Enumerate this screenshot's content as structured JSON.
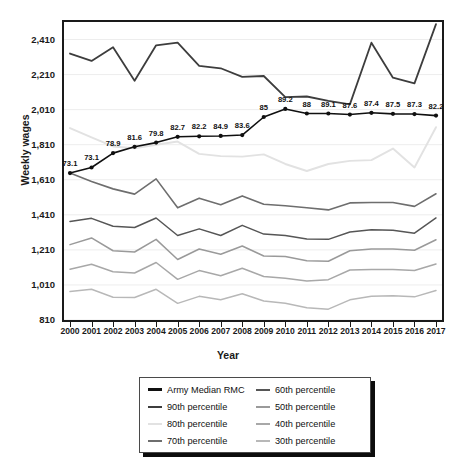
{
  "figure": {
    "y_axis_title": "Weekly wages",
    "x_axis_title": "Year"
  },
  "chart_data": {
    "type": "line",
    "title": "",
    "xlabel": "Year",
    "ylabel": "Weekly wages",
    "ylim": [
      810,
      2510
    ],
    "grid": true,
    "legend_position": "below-plot",
    "y_ticks": [
      "810",
      "1,010",
      "1,210",
      "1,410",
      "1,610",
      "1,810",
      "2,010",
      "2,210",
      "2,410"
    ],
    "y_tick_values": [
      810,
      1010,
      1210,
      1410,
      1610,
      1810,
      2010,
      2210,
      2410
    ],
    "categories": [
      "2000",
      "2001",
      "2002",
      "2003",
      "2004",
      "2005",
      "2006",
      "2007",
      "2008",
      "2009",
      "2010",
      "2011",
      "2012",
      "2013",
      "2014",
      "2015",
      "2016",
      "2017"
    ],
    "point_labels": [
      "73.1",
      "73.1",
      "78.9",
      "81.6",
      "79.8",
      "82.7",
      "82.2",
      "84.9",
      "83.6",
      "85",
      "89.2",
      "88",
      "89.1",
      "87.6",
      "87.4",
      "87.5",
      "87.3",
      "82.2"
    ],
    "series": [
      {
        "name": "Army Median RMC",
        "color": "#101010",
        "width": 1.6,
        "markers": true,
        "labelled": true,
        "values": [
          1648,
          1680,
          1762,
          1798,
          1822,
          1855,
          1858,
          1860,
          1865,
          1968,
          2014,
          1988,
          1988,
          1982,
          1992,
          1986,
          1985,
          1976
        ]
      },
      {
        "name": "90th percentile",
        "color": "#3d3d3d",
        "width": 1.8,
        "markers": false,
        "labelled": false,
        "values": [
          2330,
          2288,
          2366,
          2175,
          2377,
          2392,
          2260,
          2246,
          2197,
          2202,
          2081,
          2085,
          2060,
          2040,
          2392,
          2192,
          2160,
          2498
        ]
      },
      {
        "name": "80th percentile",
        "color": "#e2e2e2",
        "width": 1.9,
        "markers": false,
        "labelled": false,
        "values": [
          1905,
          1852,
          1800,
          1790,
          1810,
          1828,
          1758,
          1745,
          1742,
          1755,
          1700,
          1660,
          1700,
          1718,
          1722,
          1788,
          1680,
          1910
        ]
      },
      {
        "name": "70th percentile",
        "color": "#6e6e6e",
        "width": 1.6,
        "markers": false,
        "labelled": false,
        "values": [
          1648,
          1600,
          1558,
          1528,
          1615,
          1450,
          1505,
          1468,
          1518,
          1470,
          1462,
          1450,
          1438,
          1478,
          1480,
          1480,
          1458,
          1530
        ]
      },
      {
        "name": "60th percentile",
        "color": "#565656",
        "width": 1.5,
        "markers": false,
        "labelled": false,
        "values": [
          1372,
          1390,
          1345,
          1338,
          1392,
          1292,
          1330,
          1292,
          1350,
          1300,
          1292,
          1272,
          1270,
          1312,
          1325,
          1322,
          1305,
          1392
        ]
      },
      {
        "name": "50th percentile",
        "color": "#9a9a9a",
        "width": 1.5,
        "markers": false,
        "labelled": false,
        "values": [
          1240,
          1278,
          1205,
          1198,
          1270,
          1155,
          1215,
          1185,
          1232,
          1175,
          1172,
          1148,
          1145,
          1205,
          1215,
          1215,
          1208,
          1268
        ]
      },
      {
        "name": "40th percentile",
        "color": "#a8a8a8",
        "width": 1.5,
        "markers": false,
        "labelled": false,
        "values": [
          1100,
          1128,
          1085,
          1078,
          1138,
          1042,
          1092,
          1062,
          1105,
          1058,
          1048,
          1032,
          1040,
          1095,
          1098,
          1098,
          1092,
          1130
        ]
      },
      {
        "name": "30th percentile",
        "color": "#b8b8b8",
        "width": 1.5,
        "markers": false,
        "labelled": false,
        "values": [
          972,
          985,
          940,
          938,
          985,
          905,
          945,
          925,
          960,
          918,
          905,
          880,
          872,
          925,
          945,
          948,
          942,
          978
        ]
      }
    ]
  },
  "legend": {
    "items": [
      {
        "label": "Army Median RMC",
        "color": "#101010",
        "width": 3.0
      },
      {
        "label": "60th percentile",
        "color": "#565656",
        "width": 2.4
      },
      {
        "label": "90th percentile",
        "color": "#3d3d3d",
        "width": 2.6
      },
      {
        "label": "50th percentile",
        "color": "#9a9a9a",
        "width": 2.2
      },
      {
        "label": "80th percentile",
        "color": "#e2e2e2",
        "width": 2.2
      },
      {
        "label": "40th percentile",
        "color": "#a8a8a8",
        "width": 2.2
      },
      {
        "label": "70th percentile",
        "color": "#6e6e6e",
        "width": 2.4
      },
      {
        "label": "30th percentile",
        "color": "#b8b8b8",
        "width": 2.2
      }
    ]
  }
}
